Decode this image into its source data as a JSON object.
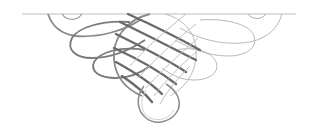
{
  "figure": {
    "title": "Decorative calligraphic flourish divider",
    "colors": {
      "background": "#ffffff",
      "rule_line": "#bdbdbd",
      "thick_stroke": "#6a6a6a",
      "thin_stroke": "#b8b8b8",
      "shadow": "#d8d8d8"
    }
  }
}
